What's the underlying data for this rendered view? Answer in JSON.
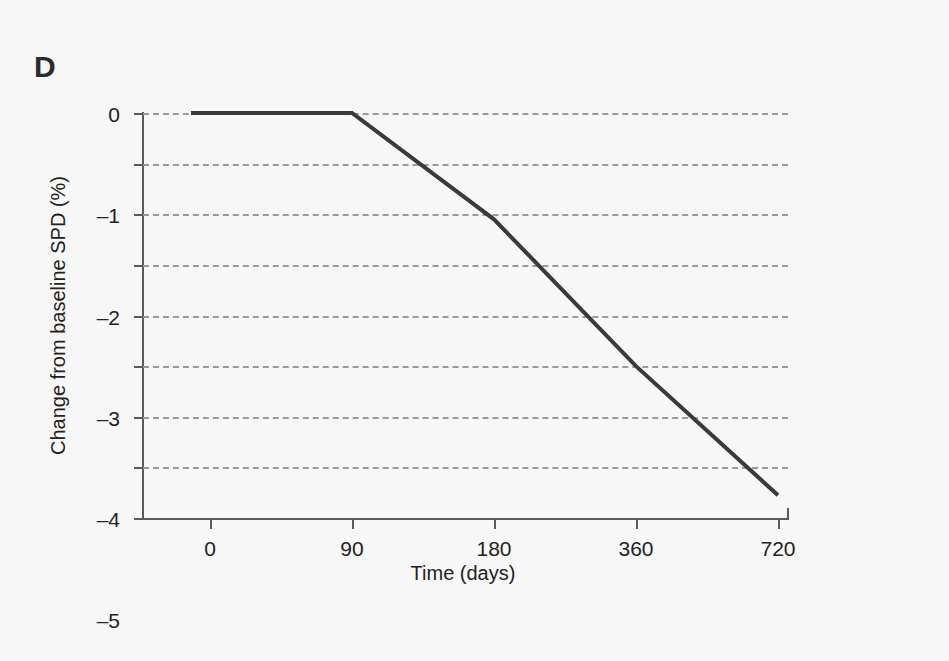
{
  "figure": {
    "panel_label": "D",
    "background_color": "#f7f7f7",
    "line_color": "#3a3a3a",
    "grid_color": "#9a9a9a",
    "axis_color": "#5a5a5a"
  },
  "chart_data": {
    "type": "line",
    "title": "",
    "panel": "D",
    "xlabel": "Time (days)",
    "ylabel": "Change from baseline SPD (%)",
    "x_tick_labels": [
      "0",
      "90",
      "180",
      "360",
      "720"
    ],
    "x_tick_values": [
      0,
      90,
      180,
      360,
      720
    ],
    "x_axis_scale": "categorical-evenly-spaced",
    "y_tick_labels": [
      "0",
      "–1",
      "–2",
      "–3",
      "–4",
      "–5",
      "–6",
      "–7",
      "–8"
    ],
    "y_tick_values": [
      0,
      -1,
      -2,
      -3,
      -4,
      -5,
      -6,
      -7,
      -8
    ],
    "ylim": [
      -8,
      0
    ],
    "grid": "horizontal-dashed",
    "legend": "none",
    "series": [
      {
        "name": "Change from baseline SPD",
        "x": [
          0,
          90,
          180,
          360,
          720
        ],
        "values": [
          0,
          0,
          -2.1,
          -5.0,
          -7.55
        ]
      }
    ],
    "annotations": [
      "Flat at 0% from day 0 through day 90",
      "Linear decline from day 90 to day 720 ending near -7.6%"
    ]
  }
}
